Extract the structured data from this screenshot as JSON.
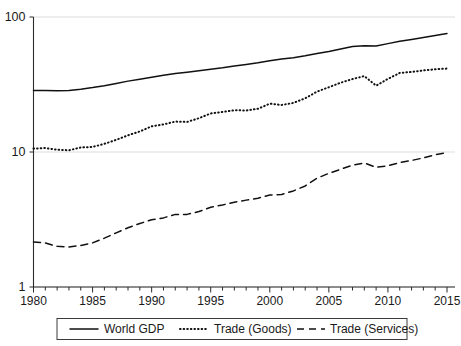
{
  "chart_data": {
    "type": "line",
    "title": "",
    "subtitle": "",
    "xlabel": "",
    "ylabel": "",
    "yscale": "log",
    "ylim": [
      1,
      100
    ],
    "xlim": [
      1980,
      2015
    ],
    "grid": true,
    "legend_position": "bottom",
    "y_ticks": [
      1,
      10,
      100
    ],
    "y_tick_labels": [
      "1",
      "10",
      "100"
    ],
    "x_ticks": [
      1980,
      1985,
      1990,
      1995,
      2000,
      2005,
      2010,
      2015
    ],
    "x_tick_labels": [
      "1980",
      "1985",
      "1990",
      "1995",
      "2000",
      "2005",
      "2010",
      "2015"
    ],
    "x_minor_tick_step": 1,
    "x": [
      1980,
      1981,
      1982,
      1983,
      1984,
      1985,
      1986,
      1987,
      1988,
      1989,
      1990,
      1991,
      1992,
      1993,
      1994,
      1995,
      1996,
      1997,
      1998,
      1999,
      2000,
      2001,
      2002,
      2003,
      2004,
      2005,
      2006,
      2007,
      2008,
      2009,
      2010,
      2011,
      2012,
      2013,
      2014,
      2015
    ],
    "series": [
      {
        "name": "World GDP",
        "style": "solid",
        "color": "#111111",
        "values": [
          28.5,
          28.6,
          28.4,
          28.6,
          29.2,
          30.0,
          31.0,
          32.2,
          33.5,
          34.6,
          35.8,
          37.0,
          38.1,
          39.0,
          40.0,
          41.0,
          42.0,
          43.4,
          44.5,
          45.8,
          47.5,
          48.8,
          50.0,
          51.6,
          53.6,
          55.6,
          58.0,
          60.4,
          61.2,
          61.0,
          63.5,
          66.0,
          68.2,
          70.5,
          73.0,
          75.5
        ]
      },
      {
        "name": "Trade (Goods)",
        "style": "dotted",
        "color": "#111111",
        "values": [
          10.6,
          10.7,
          10.4,
          10.3,
          10.8,
          10.9,
          11.5,
          12.3,
          13.3,
          14.2,
          15.5,
          16.0,
          16.8,
          16.7,
          17.8,
          19.3,
          19.8,
          20.4,
          20.3,
          20.9,
          22.8,
          22.3,
          23.1,
          25.0,
          28.0,
          30.2,
          32.6,
          34.7,
          36.5,
          31.0,
          34.8,
          38.5,
          39.2,
          40.2,
          41.0,
          41.5
        ]
      },
      {
        "name": "Trade (Services)",
        "style": "dashed",
        "color": "#111111",
        "values": [
          2.15,
          2.12,
          2.0,
          1.98,
          2.03,
          2.12,
          2.3,
          2.52,
          2.75,
          2.95,
          3.15,
          3.25,
          3.45,
          3.45,
          3.62,
          3.9,
          4.05,
          4.25,
          4.4,
          4.55,
          4.8,
          4.85,
          5.15,
          5.6,
          6.4,
          6.95,
          7.45,
          8.0,
          8.3,
          7.7,
          7.9,
          8.35,
          8.65,
          9.05,
          9.55,
          9.9
        ]
      }
    ],
    "legend_entries": [
      {
        "label": "World GDP",
        "style": "solid"
      },
      {
        "label": "Trade (Goods)",
        "style": "dotted"
      },
      {
        "label": "Trade (Services)",
        "style": "dashed"
      }
    ]
  }
}
